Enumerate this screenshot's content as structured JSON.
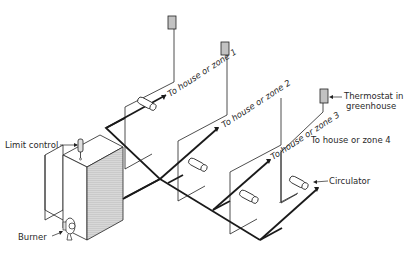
{
  "diagram": {
    "labels": {
      "zone1": "To house or zone 1",
      "zone2": "To house or zone 2",
      "zone3": "To house or zone 3",
      "zone4": "To house or zone 4",
      "limit_control": "Limit control",
      "thermostat_line1": "Thermostat in",
      "thermostat_line2": "greenhouse",
      "circulator": "Circulator",
      "burner": "Burner"
    },
    "components": [
      "boiler",
      "burner",
      "limit-control",
      "main-supply-pipe",
      "zone-branch-1",
      "zone-branch-2",
      "zone-branch-3",
      "zone-branch-4",
      "circulator-1",
      "circulator-2",
      "circulator-3",
      "circulator-4",
      "thermostat-1",
      "thermostat-2",
      "thermostat-3"
    ],
    "colors": {
      "line": "#1a1a1a",
      "shade": "#bdbdbd",
      "background": "#ffffff"
    }
  }
}
